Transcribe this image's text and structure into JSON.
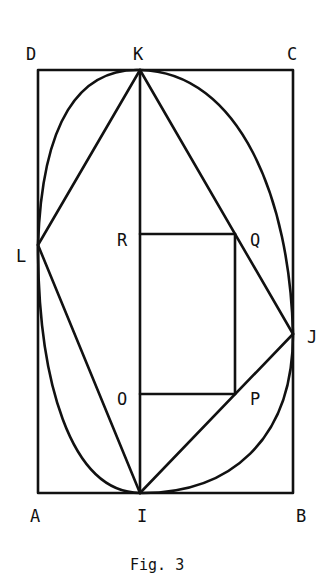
{
  "figure": {
    "caption": "Fig. 3",
    "labels": {
      "D": "D",
      "K": "K",
      "C": "C",
      "L": "L",
      "R": "R",
      "Q": "Q",
      "J": "J",
      "O": "O",
      "P": "P",
      "A": "A",
      "I": "I",
      "B": "B"
    },
    "points": {
      "A": [
        38,
        493
      ],
      "B": [
        293,
        493
      ],
      "C": [
        293,
        70
      ],
      "D": [
        38,
        70
      ],
      "K": [
        140,
        70
      ],
      "I": [
        140,
        493
      ],
      "L": [
        38,
        245
      ],
      "J": [
        293,
        334
      ],
      "R": [
        140,
        234
      ],
      "Q": [
        235,
        234
      ],
      "O": [
        140,
        394
      ],
      "P": [
        235,
        394
      ]
    },
    "colors": {
      "stroke": "#111111",
      "background": "#ffffff"
    }
  }
}
